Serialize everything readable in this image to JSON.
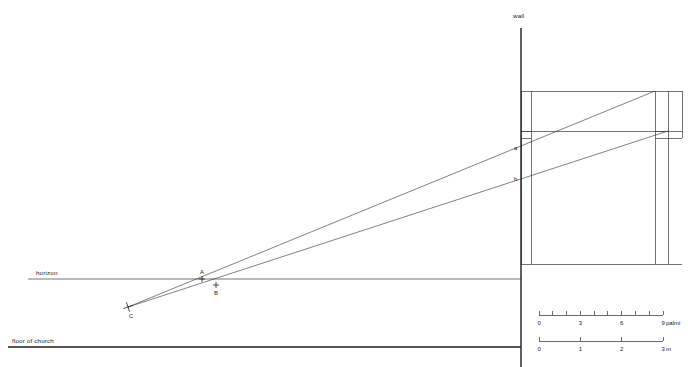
{
  "figure": {
    "width": 690,
    "height": 367,
    "background": "#ffffff",
    "ink": "#2b2b2b"
  },
  "labels": {
    "wall": "wall",
    "horizon": "horizon",
    "floor_of_church": "floor of church",
    "point_a_upper": "a",
    "point_b_lower": "b",
    "point_A": "A",
    "point_B": "B",
    "point_C": "C"
  },
  "geometry": {
    "wall_line": {
      "x": 521,
      "y1": 28,
      "y2": 367
    },
    "horizon_line": {
      "y": 279,
      "x1": 28,
      "x2": 521
    },
    "floor_line": {
      "y": 347,
      "x1": 8,
      "x2": 521
    },
    "structure_base_line": {
      "y": 264,
      "x1": 521,
      "x2": 682
    },
    "entablature": {
      "x1": 521,
      "x2": 668,
      "y_top": 91,
      "y_bottom": 131
    },
    "left_pilaster": {
      "x1": 521,
      "x2": 531,
      "y_top": 91,
      "y_bottom": 264,
      "cap_y1": 131,
      "cap_y2": 138
    },
    "right_pilaster": {
      "x1": 655,
      "x2": 668,
      "y_top": 91,
      "y_bottom": 264,
      "cap_y1": 131,
      "cap_y2": 138
    },
    "sight_line_upper": {
      "x1": 128,
      "y1": 307,
      "x2": 655,
      "y2": 91
    },
    "sight_line_lower": {
      "x1": 128,
      "y1": 307,
      "x2": 668,
      "y2": 131
    },
    "vanishing_point_C": {
      "x": 128,
      "y": 307
    },
    "point_A": {
      "x": 202,
      "y": 279
    },
    "point_B": {
      "x": 216,
      "y": 285
    },
    "wall_mark_a": {
      "x": 521,
      "y": 150
    },
    "wall_mark_b": {
      "x": 521,
      "y": 181
    }
  },
  "scales": [
    {
      "name": "palmi-scale",
      "unit_label": "9 palmi",
      "x_start": 539,
      "x_end": 663,
      "y": 315,
      "divisions": 9,
      "tick_labels": [
        {
          "value": 0,
          "text": "0"
        },
        {
          "value": 3,
          "text": "3"
        },
        {
          "value": 6,
          "text": "6"
        },
        {
          "value": 9,
          "text": "9"
        }
      ],
      "label_y": 325
    },
    {
      "name": "metre-scale",
      "unit_label": "3 m",
      "x_start": 539,
      "x_end": 663,
      "y": 341,
      "divisions": 3,
      "tick_labels": [
        {
          "value": 0,
          "text": "0"
        },
        {
          "value": 1,
          "text": "1"
        },
        {
          "value": 2,
          "text": "2"
        },
        {
          "value": 3,
          "text": "3"
        }
      ],
      "label_y": 351
    }
  ],
  "chart_data": {
    "type": "line",
    "xlabel": "",
    "ylabel": "",
    "series": [
      {
        "name": "upper sight line (C to entablature top)",
        "x": [
          128,
          655
        ],
        "y": [
          307,
          91
        ]
      },
      {
        "name": "lower sight line (C to entablature base)",
        "x": [
          128,
          668
        ],
        "y": [
          307,
          131
        ]
      },
      {
        "name": "horizon",
        "x": [
          28,
          521
        ],
        "y": [
          279,
          279
        ]
      },
      {
        "name": "floor of church",
        "x": [
          8,
          521
        ],
        "y": [
          347,
          347
        ]
      }
    ],
    "annotations": [
      {
        "text": "A",
        "x": 202,
        "y": 279
      },
      {
        "text": "B",
        "x": 216,
        "y": 285
      },
      {
        "text": "C",
        "x": 128,
        "y": 307
      },
      {
        "text": "a",
        "x": 521,
        "y": 150
      },
      {
        "text": "b",
        "x": 521,
        "y": 181
      },
      {
        "text": "wall",
        "x": 521,
        "y": 16
      },
      {
        "text": "horizon",
        "x": 36,
        "y": 274
      },
      {
        "text": "floor of church",
        "x": 12,
        "y": 342
      }
    ],
    "scales": [
      {
        "unit": "palmi",
        "range": [
          0,
          9
        ],
        "ticks": [
          0,
          1,
          2,
          3,
          4,
          5,
          6,
          7,
          8,
          9
        ],
        "labeled": [
          0,
          3,
          6,
          9
        ]
      },
      {
        "unit": "m",
        "range": [
          0,
          3
        ],
        "ticks": [
          0,
          1,
          2,
          3
        ],
        "labeled": [
          0,
          1,
          2,
          3
        ]
      }
    ],
    "grid": false,
    "legend": "none"
  }
}
